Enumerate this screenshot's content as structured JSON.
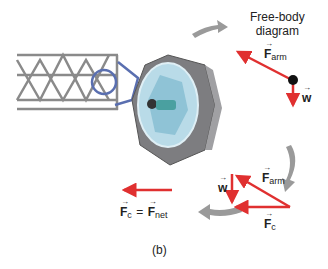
{
  "title": "Free-body\ndiagram",
  "title_line1": "Free-body",
  "title_line2": "diagram",
  "labels": {
    "f_arm": {
      "symbol": "F",
      "sub": "arm"
    },
    "w": {
      "symbol": "w"
    },
    "f_arm_triangle": {
      "symbol": "F",
      "sub": "arm"
    },
    "w_triangle": {
      "symbol": "w"
    },
    "f_c": {
      "symbol": "F",
      "sub": "c"
    },
    "equation": {
      "lhs": "F",
      "lhs_sub": "c",
      "eq": "=",
      "rhs": "F",
      "rhs_sub": "net"
    },
    "caption": "(b)"
  },
  "colors": {
    "force_arrow": "#e03030",
    "cycle_arrow": "#9a9a9a",
    "truss": "#8a8a8a",
    "arm_joint": "#5a6fb0",
    "capsule_body": "#7d7d80",
    "capsule_window": "#b9dbe8"
  }
}
